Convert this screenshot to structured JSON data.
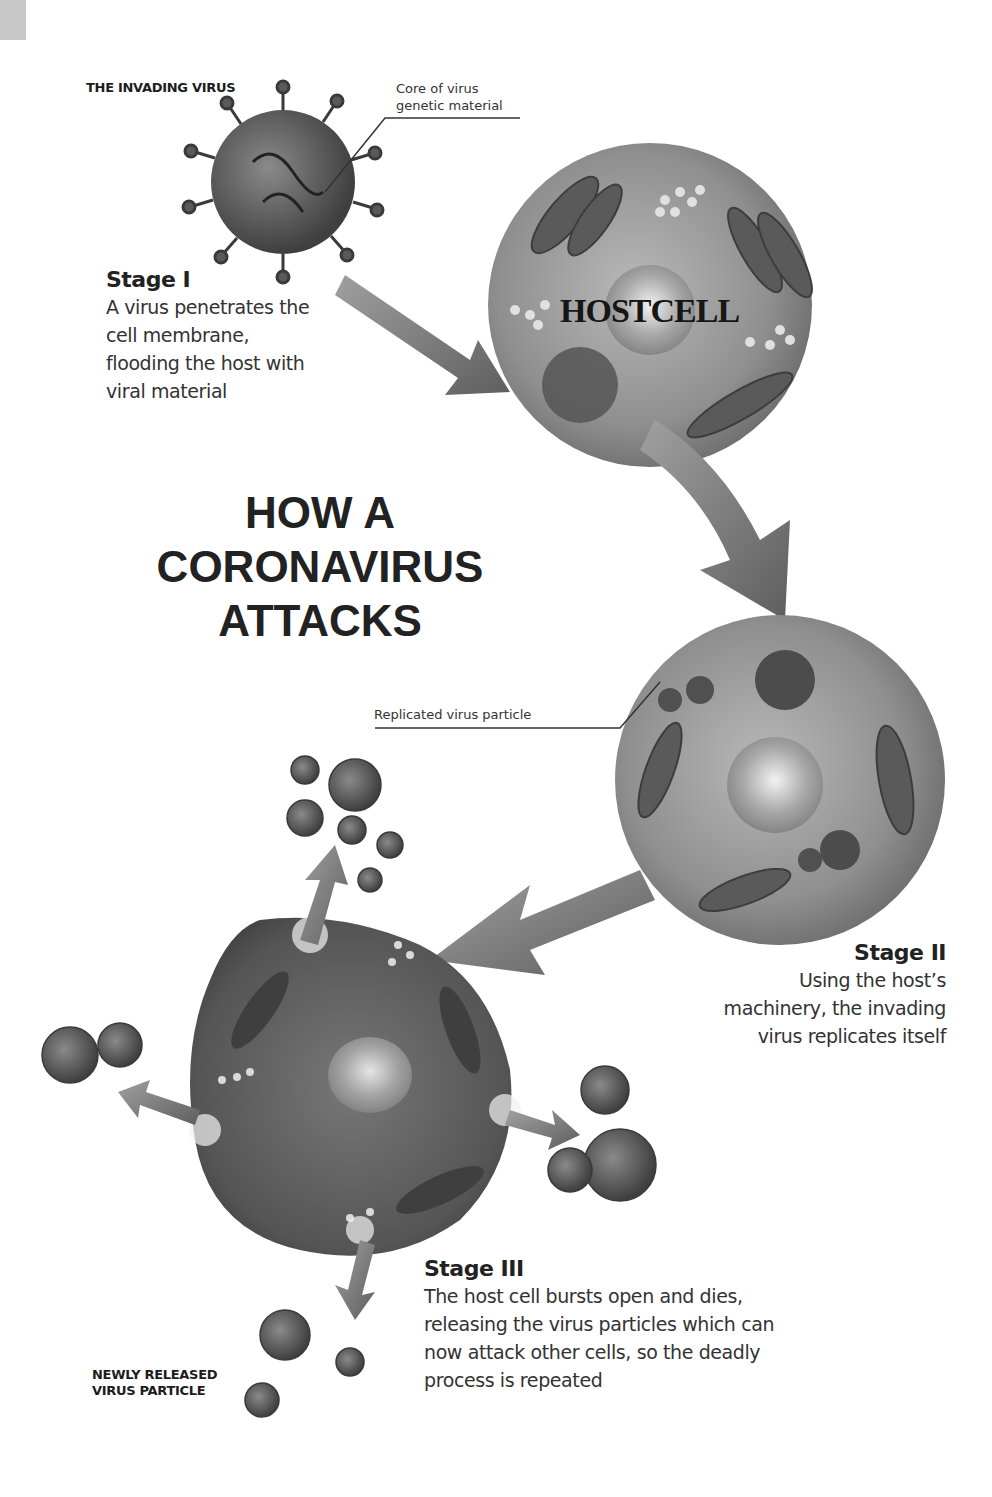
{
  "title": {
    "line1": "HOW A",
    "line2": "CORONAVIRUS",
    "line3": "ATTACKS"
  },
  "labels": {
    "invading_virus": "THE INVADING VIRUS",
    "core_line1": "Core of virus",
    "core_line2": "genetic material",
    "hostcell": "HOSTCELL",
    "replicated_particle": "Replicated virus particle",
    "newly_released_line1": "NEWLY RELEASED",
    "newly_released_line2": "VIRUS PARTICLE"
  },
  "stages": [
    {
      "title": "Stage I",
      "lines": [
        "A virus penetrates the",
        "cell membrane,",
        "flooding the host with",
        "viral material"
      ]
    },
    {
      "title": "Stage II",
      "lines": [
        "Using the host’s",
        "machinery, the invading",
        "virus replicates itself"
      ]
    },
    {
      "title": "Stage III",
      "lines": [
        "The host cell bursts open and dies,",
        "releasing the virus particles which can",
        "now attack other cells, so the deadly",
        "process is repeated"
      ]
    }
  ],
  "colors": {
    "background": "#ffffff",
    "cell_fill": "#8a8a8a",
    "cell_dark": "#555555",
    "arrow_fill": "#7a7a7a",
    "text": "#222222"
  }
}
